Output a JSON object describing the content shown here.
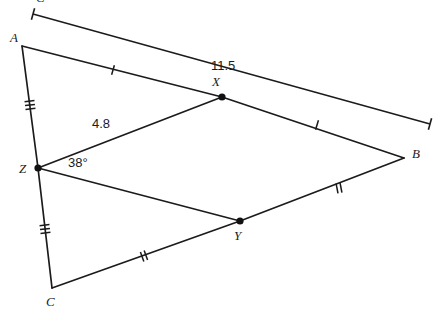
{
  "figure": {
    "background_color": "#ffffff",
    "stroke_color": "#1b1b1b"
  },
  "vertices": [
    {
      "name": "A",
      "label": "A",
      "x": 22,
      "y": 46,
      "label_x": 10,
      "label_y": 42,
      "dot": false
    },
    {
      "name": "B",
      "label": "B",
      "x": 404,
      "y": 158,
      "label_x": 412,
      "label_y": 158,
      "dot": false
    },
    {
      "name": "C",
      "label": "C",
      "x": 52,
      "y": 288,
      "label_x": 46,
      "label_y": 306,
      "dot": false
    },
    {
      "name": "X",
      "label": "X",
      "x": 222,
      "y": 97,
      "label_x": 212,
      "label_y": 86,
      "dot": true
    },
    {
      "name": "Y",
      "label": "Y",
      "x": 240,
      "y": 221,
      "label_x": 234,
      "label_y": 240,
      "dot": true
    },
    {
      "name": "Z",
      "label": "Z",
      "x": 38,
      "y": 168,
      "label_x": 19,
      "label_y": 173,
      "dot": true
    }
  ],
  "segments": [
    {
      "name": "segment-A-X",
      "from": "A",
      "to": "X",
      "ticks": 1
    },
    {
      "name": "segment-X-B",
      "from": "X",
      "to": "B",
      "ticks": 1
    },
    {
      "name": "segment-A-Z",
      "from": "A",
      "to": "Z",
      "ticks": 3
    },
    {
      "name": "segment-Z-C",
      "from": "Z",
      "to": "C",
      "ticks": 3
    },
    {
      "name": "segment-C-Y",
      "from": "C",
      "to": "Y",
      "ticks": 2
    },
    {
      "name": "segment-Y-B",
      "from": "Y",
      "to": "B",
      "ticks": 2
    },
    {
      "name": "segment-Z-X",
      "from": "Z",
      "to": "X",
      "ticks": 0
    },
    {
      "name": "segment-Z-Y",
      "from": "Z",
      "to": "Y",
      "ticks": 0
    }
  ],
  "measurements": {
    "side_length": {
      "value": "11.5",
      "label_x": 211,
      "label_y": 70,
      "dimension_line": {
        "x1": 33,
        "y1": 14,
        "x2": 430,
        "y2": 124
      }
    },
    "midsegment_length": {
      "value": "4.8",
      "label_x": 92,
      "label_y": 128
    },
    "angle": {
      "value": "38°",
      "at_vertex": "Z",
      "label_x": 68,
      "label_y": 167
    }
  },
  "tick_marks": [
    {
      "name": "tick-A-X",
      "x": 113,
      "y": 70,
      "count": 1,
      "angle": 16
    },
    {
      "name": "tick-X-B",
      "x": 317,
      "y": 125,
      "count": 1,
      "angle": 17
    },
    {
      "name": "tick-A-Z",
      "x": 30,
      "y": 105,
      "count": 3,
      "angle": 83
    },
    {
      "name": "tick-Z-C",
      "x": 45,
      "y": 229,
      "count": 3,
      "angle": 83
    },
    {
      "name": "tick-C-Y",
      "x": 144,
      "y": 256,
      "count": 2,
      "angle": -20
    },
    {
      "name": "tick-Y-B",
      "x": 339,
      "y": 188,
      "count": 2,
      "angle": -11
    }
  ],
  "clipped_label": {
    "text": "C",
    "x": 36,
    "y": 2
  }
}
